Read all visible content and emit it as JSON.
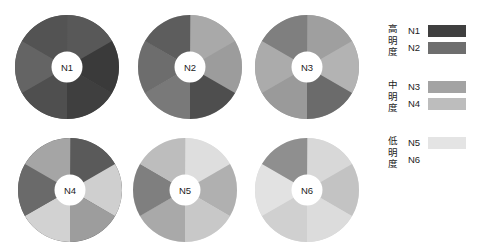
{
  "chart_data": {
    "type": "pie",
    "title": "",
    "subtitle": "",
    "xlabel": "",
    "ylabel": "",
    "legend_position": "right",
    "grid": false,
    "segment_count": 6,
    "segment_angle_deg": 60,
    "start_angle_deg": 0,
    "charts": [
      {
        "name": "N1",
        "label": "N1",
        "values": [
          16.67,
          16.67,
          16.67,
          16.67,
          16.67,
          16.67
        ],
        "colors": [
          "#585858",
          "#3a3a3a",
          "#3f3f3f",
          "#4f4f4f",
          "#646464",
          "#535353"
        ]
      },
      {
        "name": "N2",
        "label": "N2",
        "values": [
          16.67,
          16.67,
          16.67,
          16.67,
          16.67,
          16.67
        ],
        "colors": [
          "#a9a9a9",
          "#9c9c9c",
          "#4e4e4e",
          "#797979",
          "#6d6d6d",
          "#5d5d5d"
        ]
      },
      {
        "name": "N3",
        "label": "N3",
        "values": [
          16.67,
          16.67,
          16.67,
          16.67,
          16.67,
          16.67
        ],
        "colors": [
          "#9f9f9f",
          "#b3b3b3",
          "#6b6b6b",
          "#9a9a9a",
          "#ababab",
          "#7f7f7f"
        ]
      },
      {
        "name": "N4",
        "label": "N4",
        "values": [
          16.67,
          16.67,
          16.67,
          16.67,
          16.67,
          16.67
        ],
        "colors": [
          "#5a5a5a",
          "#cfcfcf",
          "#9d9d9d",
          "#d2d2d2",
          "#6a6a6a",
          "#a5a5a5"
        ]
      },
      {
        "name": "N5",
        "label": "N5",
        "values": [
          16.67,
          16.67,
          16.67,
          16.67,
          16.67,
          16.67
        ],
        "colors": [
          "#dedede",
          "#b0b0b0",
          "#c8c8c8",
          "#a9a9a9",
          "#7f7f7f",
          "#bdbdbd"
        ]
      },
      {
        "name": "N6",
        "label": "N6",
        "values": [
          16.67,
          16.67,
          16.67,
          16.67,
          16.67,
          16.67
        ],
        "colors": [
          "#d8d8d8",
          "#c3c3c3",
          "#dcdcdc",
          "#d0d0d0",
          "#e2e2e2",
          "#8f8f8f"
        ]
      }
    ],
    "legend": {
      "groups": [
        {
          "title": "高明度",
          "entries": [
            {
              "key": "N1",
              "color": "#3f3f3f",
              "swatch_visible": true
            },
            {
              "key": "N2",
              "color": "#6e6e6e",
              "swatch_visible": true
            }
          ]
        },
        {
          "title": "中明度",
          "entries": [
            {
              "key": "N3",
              "color": "#a3a3a3",
              "swatch_visible": true
            },
            {
              "key": "N4",
              "color": "#bdbdbd",
              "swatch_visible": true
            }
          ]
        },
        {
          "title": "低明度",
          "entries": [
            {
              "key": "N5",
              "color": "#e4e4e4",
              "swatch_visible": true
            },
            {
              "key": "N6",
              "color": "#ffffff",
              "swatch_visible": false
            }
          ]
        }
      ]
    }
  },
  "colors": {
    "background": "#ffffff",
    "text": "#1c1c1c",
    "hub": "#ffffff"
  }
}
